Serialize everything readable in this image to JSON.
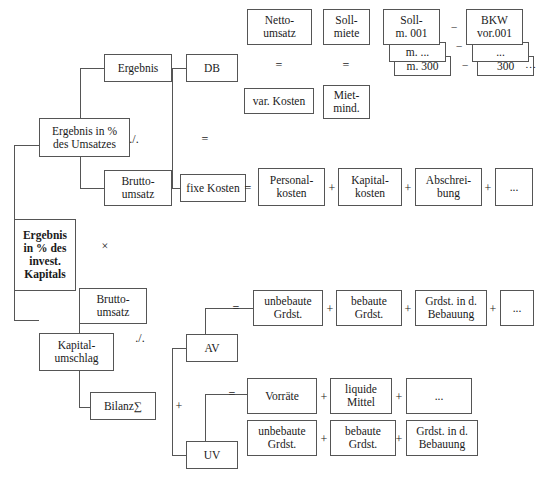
{
  "diagram": {
    "title": "Ergebnis in % des invest. Kapitals",
    "type": "roi-tree",
    "colors": {
      "background": "#ffffff",
      "box_border": "#555555",
      "line": "#555555",
      "text": "#1a1a1a"
    },
    "nodes": {
      "root": "Ergebnis\nin % des\ninvest.\nKapitals",
      "profit_margin": "Ergebnis in %\ndes Umsatzes",
      "ergebnis": "Ergebnis",
      "brutto_umsatz_top": "Brutto-\numsatz",
      "db": "DB",
      "fixe_kosten": "fixe Kosten",
      "netto_umsatz": "Netto-\numsatz",
      "var_kosten": "var. Kosten",
      "soll_miete": "Soll-\nmiete",
      "miet_mind": "Miet-\nmind.",
      "soll_m_001": "Soll-\nm. 001",
      "soll_m_dots": "m. ...",
      "soll_m_300": "m. 300",
      "bkw_vor_001": "BKW\nvor.001",
      "bkw_dots": "...",
      "bkw_300": "300",
      "personalkosten": "Personal-\nkosten",
      "kapitalkosten": "Kapital-\nkosten",
      "abschreibung": "Abschrei-\nbung",
      "fix_more": "...",
      "kapitalumschlag": "Kapital-\numschlag",
      "brutto_umsatz_bottom": "Brutto-\numsatz",
      "bilanz_summe": "Bilanz∑",
      "av": "AV",
      "uv": "UV",
      "av_unbebaute": "unbebaute\nGrdst.",
      "av_bebaute": "bebaute\nGrdst.",
      "av_bebauung": "Grdst. in d.\nBebauung",
      "av_more": "...",
      "uv_vorraete": "Vorräte",
      "uv_liquide": "liquide\nMittel",
      "uv_more": "...",
      "uv_unbebaute": "unbebaute\nGrdst.",
      "uv_bebaute": "bebaute\nGrdst.",
      "uv_bebauung": "Grdst. in d.\nBebauung"
    },
    "operators": {
      "root_mult": "×",
      "margin_div": "./.",
      "ergebnis_eq": "=",
      "netto_minus": "=",
      "miete_minus": "=",
      "soll_bkw_minus_1": "–",
      "soll_bkw_minus_2": "–",
      "soll_bkw_minus_3": "–",
      "stack_tail_dots": "...",
      "fix_eq": "=",
      "fix_plus_1": "+",
      "fix_plus_2": "+",
      "fix_plus_3": "+",
      "umschlag_div": "./.",
      "bilanz_plus": "+",
      "av_eq": "=",
      "av_plus_1": "+",
      "av_plus_2": "+",
      "av_plus_3": "+",
      "uv_eq": "=",
      "uv_plus_1": "+",
      "uv_plus_2": "+",
      "uv_row2_plus_1": "+",
      "uv_row2_plus_2": "+"
    }
  }
}
